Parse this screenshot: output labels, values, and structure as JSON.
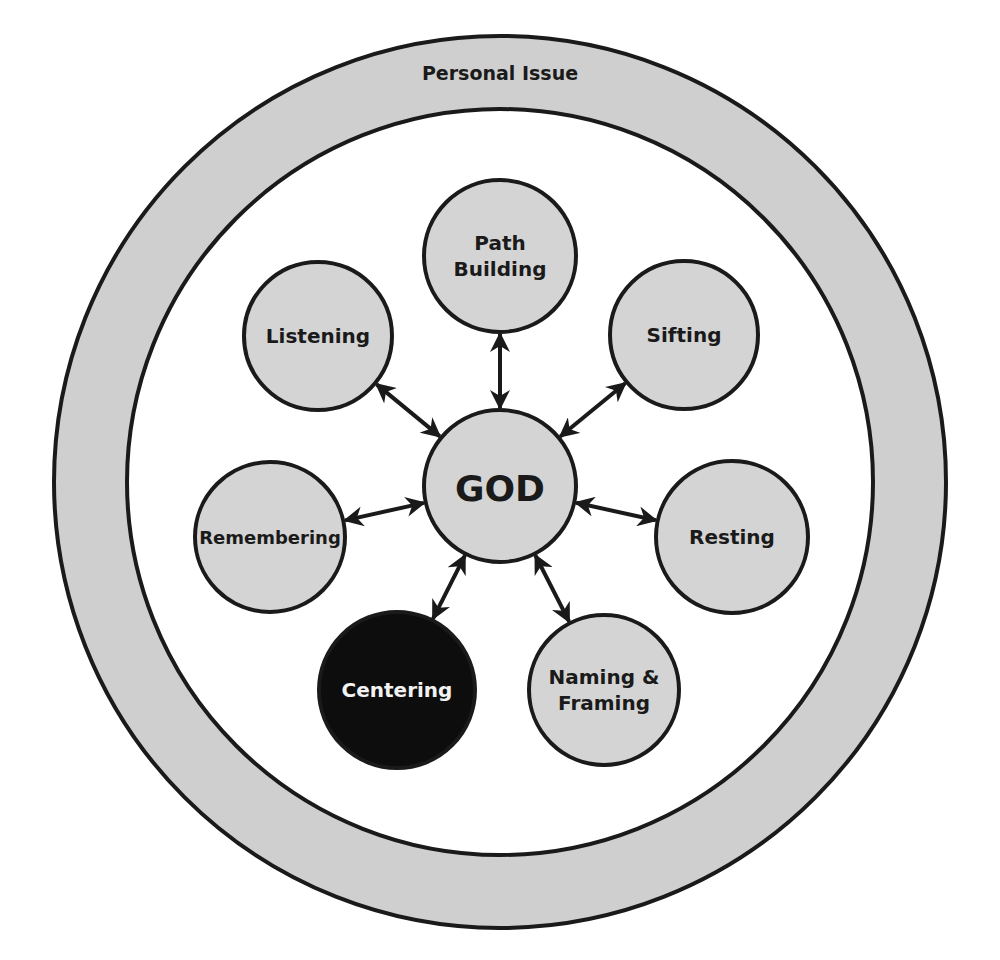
{
  "diagram": {
    "colors": {
      "background": "#ffffff",
      "ring_fill": "#cfcfcf",
      "node_fill": "#d4d4d4",
      "node_stroke": "#1a1a1a",
      "highlight_fill": "#0d0d0d",
      "highlight_text": "#f2f2f2",
      "text": "#1a1a1a",
      "arrow": "#1a1a1a"
    },
    "outer_ring": {
      "label": "Personal Issue",
      "cx": 500,
      "cy": 482,
      "outer_r": 446,
      "inner_r": 373
    },
    "center_node": {
      "id": "god",
      "label": "GOD",
      "cx": 500,
      "cy": 486,
      "r": 76
    },
    "nodes": [
      {
        "id": "path-building",
        "lines": [
          "Path",
          "Building"
        ],
        "cx": 500,
        "cy": 256,
        "r": 76,
        "highlighted": false
      },
      {
        "id": "sifting",
        "lines": [
          "Sifting"
        ],
        "cx": 684,
        "cy": 335,
        "r": 74,
        "highlighted": false
      },
      {
        "id": "resting",
        "lines": [
          "Resting"
        ],
        "cx": 732,
        "cy": 537,
        "r": 76,
        "highlighted": false
      },
      {
        "id": "naming-framing",
        "lines": [
          "Naming &",
          "Framing"
        ],
        "cx": 604,
        "cy": 690,
        "r": 75,
        "highlighted": false
      },
      {
        "id": "centering",
        "lines": [
          "Centering"
        ],
        "cx": 397,
        "cy": 690,
        "r": 78,
        "highlighted": true
      },
      {
        "id": "remembering",
        "lines": [
          "Remembering"
        ],
        "cx": 270,
        "cy": 537,
        "r": 75,
        "highlighted": false
      },
      {
        "id": "listening",
        "lines": [
          "Listening"
        ],
        "cx": 318,
        "cy": 336,
        "r": 74,
        "highlighted": false
      }
    ],
    "edges": [
      {
        "from": "god",
        "to": "path-building",
        "type": "bidirectional"
      },
      {
        "from": "god",
        "to": "sifting",
        "type": "bidirectional"
      },
      {
        "from": "god",
        "to": "resting",
        "type": "bidirectional"
      },
      {
        "from": "god",
        "to": "naming-framing",
        "type": "bidirectional"
      },
      {
        "from": "god",
        "to": "centering",
        "type": "bidirectional"
      },
      {
        "from": "god",
        "to": "remembering",
        "type": "bidirectional"
      },
      {
        "from": "god",
        "to": "listening",
        "type": "bidirectional"
      }
    ]
  }
}
